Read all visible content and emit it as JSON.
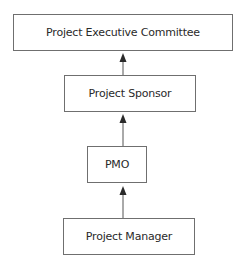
{
  "diagram": {
    "type": "organizational-hierarchy",
    "nodes": [
      {
        "id": "exec",
        "label": "Project Executive Committee"
      },
      {
        "id": "sponsor",
        "label": "Project Sponsor"
      },
      {
        "id": "pmo",
        "label": "PMO"
      },
      {
        "id": "pm",
        "label": "Project Manager"
      }
    ],
    "edges": [
      {
        "from": "sponsor",
        "to": "exec"
      },
      {
        "from": "pmo",
        "to": "sponsor"
      },
      {
        "from": "pm",
        "to": "pmo"
      }
    ],
    "colors": {
      "border": "#6f6f6f",
      "text": "#2a2a2a",
      "arrow": "#3a3a3a",
      "background": "#ffffff"
    }
  }
}
